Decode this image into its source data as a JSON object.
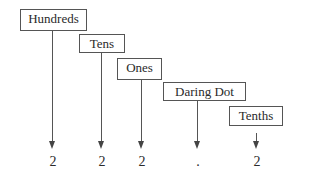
{
  "diagram": {
    "labels": [
      {
        "text": "Hundreds"
      },
      {
        "text": "Tens"
      },
      {
        "text": "Ones"
      },
      {
        "text": "Daring Dot"
      },
      {
        "text": "Tenths"
      }
    ],
    "digits": [
      "2",
      "2",
      "2",
      ".",
      "2"
    ]
  }
}
